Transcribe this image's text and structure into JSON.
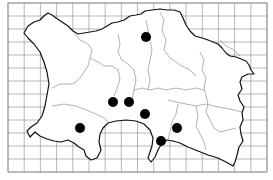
{
  "map": {
    "title": "",
    "grid": {
      "x0": 8,
      "y0": 3,
      "x1": 267,
      "y1": 172,
      "cols": 16,
      "rows": 13,
      "color": "#9a9a9a"
    },
    "coast_color": "#111111",
    "boundary_color": "#7d7d7d",
    "dot_color": "#000000",
    "dot_radius": 5,
    "record_dots": [
      {
        "x": 146,
        "y": 37
      },
      {
        "x": 113,
        "y": 102
      },
      {
        "x": 129,
        "y": 102
      },
      {
        "x": 145,
        "y": 114
      },
      {
        "x": 80,
        "y": 128
      },
      {
        "x": 177,
        "y": 128
      },
      {
        "x": 161,
        "y": 141
      }
    ]
  }
}
